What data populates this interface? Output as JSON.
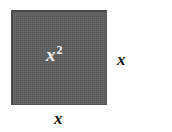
{
  "figure": {
    "kind": "geometry-diagram",
    "shape": "square",
    "background_color": "#ffffff",
    "fill_color": "#5e5e5e",
    "border_color": "#4a4a4a",
    "label_color_inside": "#f2f2f2",
    "label_color_outside": "#141414",
    "area_label": {
      "base": "x",
      "exponent": "2",
      "full_text": "x²"
    },
    "right_side_label": "x",
    "bottom_side_label": "x"
  }
}
